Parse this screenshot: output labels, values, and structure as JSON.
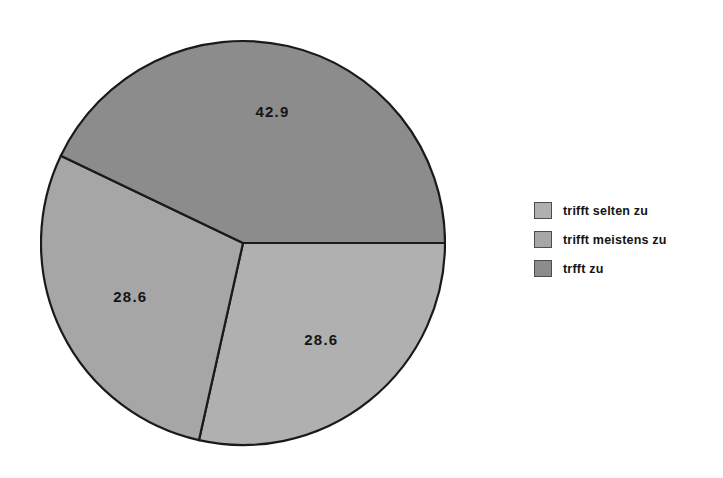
{
  "chart_data": {
    "type": "pie",
    "title": "",
    "categories": [
      "trifft selten zu",
      "trifft meistens zu",
      "trfft zu"
    ],
    "values": [
      28.6,
      28.6,
      42.9
    ],
    "value_labels": [
      "28.6",
      "28.6",
      "42.9"
    ],
    "unit": "percent",
    "legend_position": "right",
    "grid": false,
    "slices": [
      {
        "label": "trifft selten zu",
        "value": 28.6,
        "value_label": "28.6",
        "color": "#b0b0b0",
        "position": "bottom-right",
        "start_angle_deg": 257.4,
        "end_angle_deg": 360.0
      },
      {
        "label": "trifft meistens zu",
        "value": 28.6,
        "value_label": "28.6",
        "color": "#a6a6a6",
        "position": "left",
        "start_angle_deg": 154.4,
        "end_angle_deg": 257.4
      },
      {
        "label": "trfft zu",
        "value": 42.9,
        "value_label": "42.9",
        "color": "#8c8c8c",
        "position": "top",
        "start_angle_deg": 0.0,
        "end_angle_deg": 154.4
      }
    ]
  },
  "legend": {
    "items": [
      {
        "label": "trifft selten zu",
        "color": "#b0b0b0"
      },
      {
        "label": "trifft meistens zu",
        "color": "#a6a6a6"
      },
      {
        "label": "trfft zu",
        "color": "#8c8c8c"
      }
    ]
  },
  "style": {
    "background": "#ffffff",
    "outline": "#1a1a1a",
    "label_color": "#151515"
  }
}
